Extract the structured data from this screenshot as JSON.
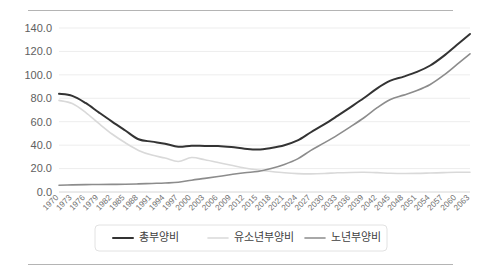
{
  "figure": {
    "rule_color": "#b4b4b4",
    "background": "#ffffff"
  },
  "chart_data": {
    "type": "line",
    "title": "",
    "subtitle": "",
    "xlabel": "",
    "ylabel": "",
    "ylim": [
      0,
      140
    ],
    "ytick_step": 20,
    "grid": true,
    "legend_position": "bottom",
    "ytick_labels": [
      "0.0",
      "20.0",
      "40.0",
      "60.0",
      "80.0",
      "100.0",
      "120.0",
      "140.0"
    ],
    "ytick_values": [
      0,
      20,
      40,
      60,
      80,
      100,
      120,
      140
    ],
    "x": [
      1970,
      1973,
      1976,
      1979,
      1982,
      1985,
      1988,
      1991,
      1994,
      1997,
      2000,
      2003,
      2006,
      2009,
      2012,
      2015,
      2018,
      2021,
      2024,
      2027,
      2030,
      2033,
      2036,
      2039,
      2042,
      2045,
      2048,
      2051,
      2054,
      2057,
      2060,
      2063
    ],
    "xtick_labels": [
      "1970",
      "1973",
      "1976",
      "1979",
      "1982",
      "1985",
      "1988",
      "1991",
      "1994",
      "1997",
      "2000",
      "2003",
      "2006",
      "2009",
      "2012",
      "2015",
      "2018",
      "2021",
      "2024",
      "2027",
      "2030",
      "2033",
      "2036",
      "2039",
      "2042",
      "2045",
      "2048",
      "2051",
      "2054",
      "2057",
      "2060",
      "2063"
    ],
    "xtick_rotation": -45,
    "series": [
      {
        "name": "총부양비",
        "color": "#333333",
        "width": 2.0,
        "values": [
          83.8,
          82.1,
          76.0,
          68.0,
          60.1,
          52.5,
          45.0,
          43.0,
          41.2,
          38.6,
          39.5,
          39.3,
          39.3,
          38.4,
          37.0,
          36.2,
          37.6,
          39.9,
          44.0,
          51.0,
          57.7,
          65.0,
          72.5,
          80.2,
          88.5,
          95.0,
          98.5,
          102.5,
          108.0,
          116.0,
          125.5,
          134.9
        ]
      },
      {
        "name": "유소년부양비",
        "color": "#d9d9d9",
        "width": 1.6,
        "values": [
          78.2,
          75.5,
          68.0,
          58.5,
          49.5,
          42.0,
          35.5,
          31.5,
          29.0,
          26.0,
          29.4,
          27.5,
          25.2,
          22.8,
          20.5,
          18.8,
          17.5,
          16.4,
          15.7,
          15.5,
          15.8,
          16.4,
          16.7,
          16.8,
          16.5,
          16.0,
          15.8,
          15.9,
          16.2,
          16.5,
          16.8,
          16.9
        ]
      },
      {
        "name": "노년부양비",
        "color": "#8c8c8c",
        "width": 1.6,
        "values": [
          5.7,
          6.1,
          6.3,
          6.4,
          6.5,
          6.6,
          6.9,
          7.3,
          7.7,
          8.3,
          10.1,
          11.6,
          13.2,
          14.9,
          16.5,
          17.5,
          20.0,
          23.5,
          28.3,
          35.5,
          41.9,
          48.6,
          55.8,
          63.4,
          72.0,
          79.0,
          82.7,
          86.6,
          91.8,
          99.5,
          108.7,
          118.0
        ]
      }
    ]
  },
  "legend": {
    "items": [
      {
        "label": "총부양비",
        "color": "#333333"
      },
      {
        "label": "유소년부양비",
        "color": "#d9d9d9"
      },
      {
        "label": "노년부양비",
        "color": "#8c8c8c"
      }
    ]
  }
}
